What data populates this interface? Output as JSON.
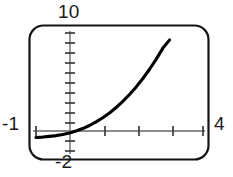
{
  "figure": {
    "name": "graphing-calculator-viewport",
    "background_color": "#ffffff",
    "frame_color": "#141414",
    "axis_color": "#8c8c8c",
    "tick_color": "#3a3a3a",
    "curve_color": "#000000"
  },
  "window_labels": {
    "ymax": "10",
    "xmin": "-1",
    "xmax": "4",
    "ymin": "-2"
  },
  "chart_data": {
    "type": "line",
    "title": "",
    "xlabel": "",
    "ylabel": "",
    "xlim": [
      -1,
      4
    ],
    "ylim": [
      -2,
      10
    ],
    "grid": false,
    "legend": null,
    "axes": {
      "x_axis_at_y": 0,
      "y_axis_at_x": 0,
      "x_tick_interval": 1,
      "y_tick_interval": 1,
      "x_ticks": [
        -1,
        0,
        1,
        2,
        3,
        4
      ],
      "y_ticks": [
        -2,
        -1,
        0,
        1,
        2,
        3,
        4,
        5,
        6,
        7,
        8,
        9,
        10
      ]
    },
    "series": [
      {
        "name": "curve",
        "x": [
          -1.0,
          -0.8,
          -0.6,
          -0.4,
          -0.2,
          0.0,
          0.2,
          0.4,
          0.6,
          0.8,
          1.0,
          1.2,
          1.4,
          1.6,
          1.8,
          2.0,
          2.2,
          2.4,
          2.6,
          2.8,
          3.0
        ],
        "y": [
          -0.67,
          -0.62,
          -0.55,
          -0.47,
          -0.36,
          -0.2,
          0.0,
          0.25,
          0.56,
          0.93,
          1.35,
          1.84,
          2.4,
          3.02,
          3.72,
          4.5,
          5.36,
          6.3,
          7.33,
          8.46,
          9.3
        ]
      }
    ]
  }
}
